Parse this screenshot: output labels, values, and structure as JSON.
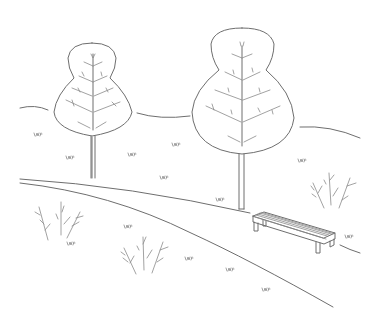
{
  "scene": {
    "description": "Line-drawing illustration of a park with two trees, a curving path, a bench, shrubs and grass tufts",
    "stroke_color": "#6e6e6e",
    "background": "#ffffff"
  },
  "trees": [
    {
      "name": "left-tree",
      "x": 92,
      "top": 42,
      "bottom": 178
    },
    {
      "name": "right-tree",
      "x": 242,
      "top": 28,
      "bottom": 209
    }
  ],
  "bench": {
    "x": 252,
    "y": 212
  },
  "shrubs": [
    {
      "name": "left-shrub",
      "x": 52,
      "y": 225
    },
    {
      "name": "middle-shrub",
      "x": 145,
      "y": 255
    },
    {
      "name": "right-shrub",
      "x": 330,
      "y": 192
    }
  ],
  "grass_tufts": [
    [
      34,
      135
    ],
    [
      66,
      158
    ],
    [
      128,
      155
    ],
    [
      172,
      145
    ],
    [
      160,
      178
    ],
    [
      298,
      161
    ],
    [
      216,
      200
    ],
    [
      124,
      227
    ],
    [
      185,
      259
    ],
    [
      226,
      270
    ],
    [
      262,
      290
    ],
    [
      67,
      244
    ],
    [
      345,
      237
    ]
  ]
}
